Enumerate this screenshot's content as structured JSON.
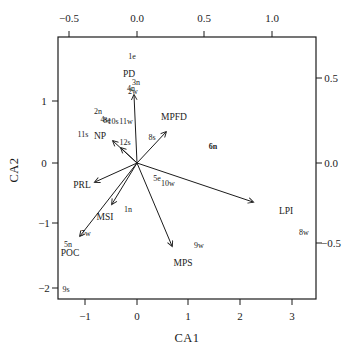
{
  "figure": {
    "type": "ca-ordination-biplot",
    "background": "#ffffff",
    "line_color": "#1b1b1b",
    "text_color": "#1b1b1b"
  },
  "plot_box": {
    "left": 58,
    "top": 37,
    "right": 316,
    "bottom": 299
  },
  "origin": {
    "x": 137,
    "y": 163
  },
  "axes": {
    "top": {
      "ticks": [
        {
          "label": "−0.5",
          "x": 69
        },
        {
          "label": "0.0",
          "x": 137
        },
        {
          "label": "0.5",
          "x": 204
        },
        {
          "label": "1.0",
          "x": 272
        }
      ]
    },
    "bottom": {
      "title": "CA1",
      "title_x": 187,
      "title_y": 338,
      "ticks": [
        {
          "label": "−1",
          "x": 85
        },
        {
          "label": "0",
          "x": 137
        },
        {
          "label": "1",
          "x": 188
        },
        {
          "label": "2",
          "x": 240
        },
        {
          "label": "3",
          "x": 292
        }
      ]
    },
    "left": {
      "title": "CA2",
      "title_x": 14,
      "title_y": 170,
      "ticks": [
        {
          "label": "1",
          "y": 101
        },
        {
          "label": "0",
          "y": 163
        },
        {
          "label": "−1",
          "y": 223
        },
        {
          "label": "−2",
          "y": 288
        }
      ]
    },
    "right": {
      "ticks": [
        {
          "label": "0.5",
          "y": 78
        },
        {
          "label": "0.0",
          "y": 163
        },
        {
          "label": "−0.5",
          "y": 243
        }
      ]
    }
  },
  "arrows": [
    {
      "name": "PD",
      "tip_x": 134,
      "tip_y": 95,
      "label": "PD",
      "label_x": 129,
      "label_y": 75
    },
    {
      "name": "MPFD",
      "tip_x": 166,
      "tip_y": 132,
      "label": "MPFD",
      "label_x": 174,
      "label_y": 118
    },
    {
      "name": "NP",
      "tip_x": 113,
      "tip_y": 141,
      "label": "NP",
      "label_x": 100,
      "label_y": 137
    },
    {
      "name": "stub",
      "tip_x": 121,
      "tip_y": 148,
      "label": "",
      "label_x": 0,
      "label_y": 0
    },
    {
      "name": "PRL",
      "tip_x": 95,
      "tip_y": 182,
      "label": "PRL",
      "label_x": 82,
      "label_y": 186
    },
    {
      "name": "MSI",
      "tip_x": 112,
      "tip_y": 204,
      "label": "MSI",
      "label_x": 105,
      "label_y": 218
    },
    {
      "name": "POC",
      "tip_x": 80,
      "tip_y": 236,
      "label": "POC",
      "label_x": 70,
      "label_y": 254
    },
    {
      "name": "MPS",
      "tip_x": 172,
      "tip_y": 246,
      "label": "MPS",
      "label_x": 183,
      "label_y": 264
    },
    {
      "name": "LPI",
      "tip_x": 253,
      "tip_y": 202,
      "label": "LPI",
      "label_x": 286,
      "label_y": 212
    }
  ],
  "site_labels": [
    {
      "text": "1e",
      "x": 132,
      "y": 57,
      "bold": false
    },
    {
      "text": "3n",
      "x": 136,
      "y": 83,
      "bold": false
    },
    {
      "text": "4n",
      "x": 131,
      "y": 89,
      "bold": false
    },
    {
      "text": "2w",
      "x": 133,
      "y": 92,
      "bold": false
    },
    {
      "text": "2n",
      "x": 98,
      "y": 112,
      "bold": false
    },
    {
      "text": "4s",
      "x": 104,
      "y": 120,
      "bold": false
    },
    {
      "text": "8e",
      "x": 107,
      "y": 121,
      "bold": false
    },
    {
      "text": "10s",
      "x": 113,
      "y": 122,
      "bold": false
    },
    {
      "text": "11w",
      "x": 126,
      "y": 122,
      "bold": false
    },
    {
      "text": "11s",
      "x": 83,
      "y": 135,
      "bold": false
    },
    {
      "text": "12s",
      "x": 125,
      "y": 143,
      "bold": false
    },
    {
      "text": "8s",
      "x": 152,
      "y": 138,
      "bold": false
    },
    {
      "text": "6n",
      "x": 213,
      "y": 147,
      "bold": true
    },
    {
      "text": "5e",
      "x": 157,
      "y": 179,
      "bold": false
    },
    {
      "text": "10w",
      "x": 168,
      "y": 184,
      "bold": false
    },
    {
      "text": "1n",
      "x": 128,
      "y": 210,
      "bold": false
    },
    {
      "text": "7w",
      "x": 86,
      "y": 234,
      "bold": false
    },
    {
      "text": "5n",
      "x": 68,
      "y": 245,
      "bold": false
    },
    {
      "text": "9s",
      "x": 66,
      "y": 290,
      "bold": false
    },
    {
      "text": "9w",
      "x": 199,
      "y": 246,
      "bold": false
    },
    {
      "text": "8w",
      "x": 304,
      "y": 233,
      "bold": false
    },
    {
      "text": "MPS-spacer",
      "x": -100,
      "y": -100,
      "bold": false
    }
  ],
  "chart_data": {
    "type": "scatter",
    "subtype": "correspondence-analysis-biplot",
    "xlabel": "CA1",
    "ylabel": "CA2",
    "site_axis_ranges": {
      "x": [
        -1.5,
        3.5
      ],
      "y": [
        -2.2,
        1.6
      ]
    },
    "arrow_axis_ranges": {
      "x": [
        -0.6,
        1.3
      ],
      "y": [
        -0.8,
        0.75
      ]
    },
    "grid": false,
    "legend": "none",
    "arrows_scale": "top/right axes (−0.5…1.0, 0.5…−0.5)",
    "sites_scale": "bottom/left axes (−1…3, 1…−2)",
    "arrow_vectors": [
      {
        "name": "PD",
        "x": -0.02,
        "y": 0.41
      },
      {
        "name": "MPFD",
        "x": 0.21,
        "y": 0.19
      },
      {
        "name": "NP",
        "x": -0.18,
        "y": 0.13
      },
      {
        "name": "PRL",
        "x": -0.31,
        "y": -0.12
      },
      {
        "name": "MSI",
        "x": -0.18,
        "y": -0.25
      },
      {
        "name": "POC",
        "x": -0.42,
        "y": -0.44
      },
      {
        "name": "MPS",
        "x": 0.26,
        "y": -0.5
      },
      {
        "name": "LPI",
        "x": 0.86,
        "y": -0.24
      }
    ],
    "site_points": [
      {
        "label": "1e",
        "x": -0.1,
        "y": 1.7
      },
      {
        "label": "3n",
        "x": -0.04,
        "y": 1.28
      },
      {
        "label": "4n",
        "x": -0.14,
        "y": 1.19
      },
      {
        "label": "2w",
        "x": -0.08,
        "y": 1.14
      },
      {
        "label": "2n",
        "x": -0.75,
        "y": 0.82
      },
      {
        "label": "4s",
        "x": -0.66,
        "y": 0.69
      },
      {
        "label": "8e",
        "x": -0.6,
        "y": 0.67
      },
      {
        "label": "10s",
        "x": -0.5,
        "y": 0.66
      },
      {
        "label": "11w",
        "x": -0.25,
        "y": 0.66
      },
      {
        "label": "11s",
        "x": -1.04,
        "y": 0.45
      },
      {
        "label": "12s",
        "x": -0.25,
        "y": 0.32
      },
      {
        "label": "8s",
        "x": 0.27,
        "y": 0.4
      },
      {
        "label": "6n",
        "x": 1.47,
        "y": 0.26
      },
      {
        "label": "5e",
        "x": 0.37,
        "y": -0.26
      },
      {
        "label": "10w",
        "x": 0.56,
        "y": -0.34
      },
      {
        "label": "1n",
        "x": -0.19,
        "y": -0.75
      },
      {
        "label": "7w",
        "x": -1.01,
        "y": -1.14
      },
      {
        "label": "5n",
        "x": -1.35,
        "y": -1.32
      },
      {
        "label": "9s",
        "x": -1.39,
        "y": -2.04
      },
      {
        "label": "9w",
        "x": 1.18,
        "y": -1.33
      },
      {
        "label": "8w",
        "x": 3.21,
        "y": -1.12
      }
    ]
  }
}
